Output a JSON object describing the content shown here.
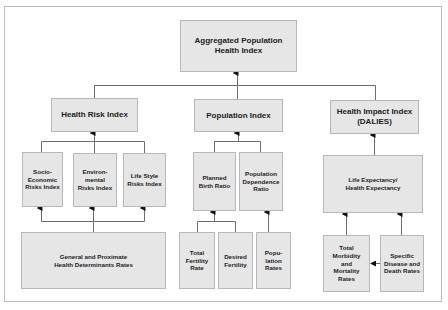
{
  "diagram": {
    "root": {
      "label": "Aggregated Population\nHealth Index"
    },
    "level1": [
      {
        "id": "health-risk",
        "label": "Health Risk Index"
      },
      {
        "id": "population",
        "label": "Population Index"
      },
      {
        "id": "health-impact",
        "label": "Health Impact Index\n(DALIES)"
      }
    ],
    "level2": {
      "health_risk": [
        {
          "label": "Socio-\nEconomic\nRisks Index"
        },
        {
          "label": "Environ-\nmental\nRisks Index"
        },
        {
          "label": "Life Style\nRisks Index"
        }
      ],
      "population": [
        {
          "label": "Planned\nBirth Ratio"
        },
        {
          "label": "Population\nDependence\nRatio"
        }
      ],
      "health_impact": [
        {
          "label": "Life Expectancy/\nHealth Expectancy"
        }
      ]
    },
    "level3": {
      "health_risk": [
        {
          "label": "General and Proximate\nHealth Determinants Rates"
        }
      ],
      "population": [
        {
          "label": "Total\nFertility\nRate"
        },
        {
          "label": "Desired\nFertility"
        },
        {
          "label": "Popu-\nlation\nRates"
        }
      ],
      "health_impact": [
        {
          "label": "Total\nMorbidity\nand\nMortality\nRates"
        },
        {
          "label": "Specific\nDisease and\nDeath Rates"
        }
      ]
    },
    "colors": {
      "box_fill": "#e6e6e6",
      "box_border": "#b8b8b8",
      "connector": "#6e6e6e",
      "arrow": "#111111",
      "frame": "#bdbdbd"
    }
  }
}
